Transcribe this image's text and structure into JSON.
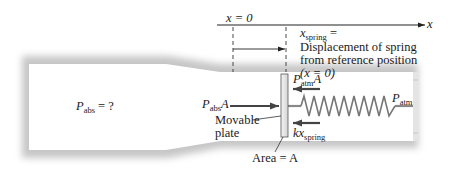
{
  "diagram": {
    "type": "pressure-gauge-schematic",
    "axis": {
      "label": "x",
      "origin_label": "x = 0"
    },
    "annotation": {
      "xspring_symbol": "x",
      "xspring_sub": "spring",
      "equals": " =",
      "line1": "Displacement of spring",
      "line2": "from reference position",
      "line3": "(x = 0)"
    },
    "labels": {
      "p_abs_question": {
        "p": "P",
        "sub": "abs",
        "rest": " = ?"
      },
      "p_abs_force": {
        "p": "P",
        "sub": "abs",
        "rest": "A"
      },
      "p_atm_force": {
        "p": "P",
        "sub": "atm",
        "rest": "A"
      },
      "p_atm": {
        "p": "P",
        "sub": "atm"
      },
      "spring_force": {
        "k": "kx",
        "sub": "spring"
      },
      "movable_plate_1": "Movable",
      "movable_plate_2": "plate",
      "area": "Area = A"
    },
    "colors": {
      "pipe_shadow": "#c8c8c8",
      "pipe_interior": "#ffffff",
      "arrow": "#444444",
      "line": "#222222",
      "spring": "#777777",
      "plate": "#e6e6e6"
    }
  }
}
